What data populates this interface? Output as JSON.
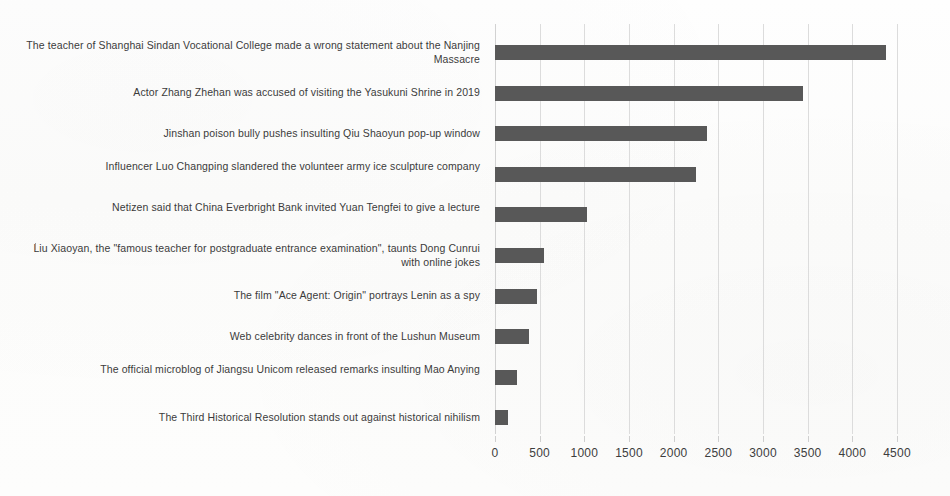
{
  "chart_data": {
    "type": "bar",
    "orientation": "horizontal",
    "title": "",
    "xlabel": "",
    "ylabel": "",
    "xlim": [
      0,
      4500
    ],
    "ylim": null,
    "grid": true,
    "legend": false,
    "bar_color": "#585858",
    "gridline_color": "#dcdcdc",
    "background_color": "#fdfdfc",
    "text_color": "#3b3b3b",
    "xticks": [
      0,
      500,
      1000,
      1500,
      2000,
      2500,
      3000,
      3500,
      4000,
      4500
    ],
    "xtick_labels": [
      "0",
      "500",
      "1000",
      "1500",
      "2000",
      "2500",
      "3000",
      "3500",
      "4000",
      "4500"
    ],
    "categories": [
      "The teacher of Shanghai Sindan Vocational College made a wrong statement about the Nanjing Massacre",
      "Actor Zhang Zhehan was accused of visiting the Yasukuni Shrine in 2019",
      "Jinshan poison bully pushes insulting Qiu Shaoyun pop-up window",
      "Influencer Luo Changping slandered the volunteer army ice sculpture company",
      "Netizen said that China Everbright Bank invited Yuan Tengfei to give a lecture",
      "Liu Xiaoyan, the \"famous teacher for postgraduate entrance examination\", taunts Dong Cunrui with online jokes",
      "The film \"Ace Agent: Origin\" portrays Lenin as a spy",
      "Web celebrity dances in front of the Lushun Museum",
      "The official microblog of Jiangsu Unicom released remarks insulting Mao Anying",
      "The Third Historical Resolution stands out against historical nihilism"
    ],
    "values": [
      4380,
      3450,
      2370,
      2250,
      1030,
      545,
      470,
      375,
      250,
      150
    ]
  }
}
